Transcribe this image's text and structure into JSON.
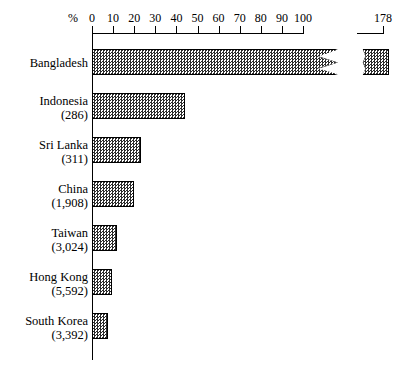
{
  "chart_data": {
    "type": "bar",
    "orientation": "horizontal",
    "title": "",
    "xlabel": "%",
    "ylabel": "",
    "xlim": [
      0,
      100
    ],
    "grid": false,
    "legend": null,
    "axis_break": {
      "present": true,
      "break_label": "178",
      "note": "axis broken between 100 and 178"
    },
    "categories": [
      "Bangladesh",
      "Indonesia",
      "Sri Lanka",
      "China",
      "Taiwan",
      "Hong Kong",
      "South Korea"
    ],
    "sample_sizes": [
      "",
      "(286)",
      "(311)",
      "(1,908)",
      "(3,024)",
      "(5,592)",
      "(3,392)"
    ],
    "values": [
      178,
      44,
      23,
      20,
      12,
      9.5,
      7.5
    ],
    "tick_labels": [
      "0",
      "10",
      "20",
      "30",
      "40",
      "50",
      "60",
      "70",
      "80",
      "90",
      "100"
    ],
    "tick_values": [
      0,
      10,
      20,
      30,
      40,
      50,
      60,
      70,
      80,
      90,
      100
    ],
    "break_tick_label": "178",
    "colors": {
      "bar_fill": "#2b2b2b",
      "bar_background": "#ffffff",
      "axis": "#000000",
      "text": "#000000",
      "page_background": "#ffffff"
    }
  },
  "axis": {
    "unit_label": "%",
    "break_value_label": "178"
  },
  "rows": [
    {
      "name": "Bangladesh",
      "n": "",
      "value": 178
    },
    {
      "name": "Indonesia",
      "n": "(286)",
      "value": 44
    },
    {
      "name": "Sri Lanka",
      "n": "(311)",
      "value": 23
    },
    {
      "name": "China",
      "n": "(1,908)",
      "value": 20
    },
    {
      "name": "Taiwan",
      "n": "(3,024)",
      "value": 12
    },
    {
      "name": "Hong Kong",
      "n": "(5,592)",
      "value": 9.5
    },
    {
      "name": "South Korea",
      "n": "(3,392)",
      "value": 7.5
    }
  ]
}
